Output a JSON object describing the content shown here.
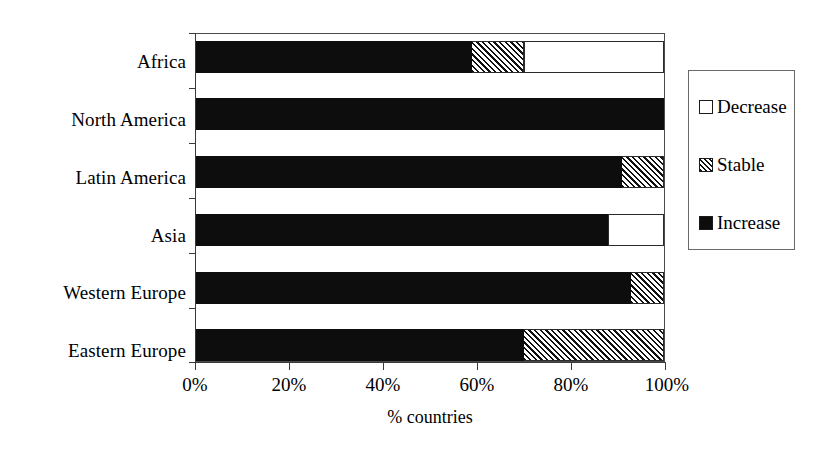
{
  "chart_data": {
    "type": "bar",
    "orientation": "horizontal",
    "stacked": true,
    "stacked_normalized": true,
    "title": "",
    "xlabel": "% countries",
    "ylabel": "",
    "xlim": [
      0,
      100
    ],
    "xticks": [
      "0%",
      "20%",
      "40%",
      "60%",
      "80%",
      "100%"
    ],
    "xtick_values": [
      0,
      20,
      40,
      60,
      80,
      100
    ],
    "grid": false,
    "legend_position": "right",
    "categories": [
      "Africa",
      "North America",
      "Latin America",
      "Asia",
      "Western Europe",
      "Eastern Europe"
    ],
    "series": [
      {
        "name": "Increase",
        "fill": "solid-black",
        "color": "#0d0d0d",
        "values": [
          59,
          100,
          91,
          88,
          93,
          70
        ]
      },
      {
        "name": "Stable",
        "fill": "diagonal-hatch",
        "color": "#111111",
        "values": [
          11,
          0,
          9,
          0,
          7,
          30
        ]
      },
      {
        "name": "Decrease",
        "fill": "white",
        "color": "#ffffff",
        "values": [
          30,
          0,
          0,
          12,
          0,
          0
        ]
      }
    ],
    "legend_entries": [
      {
        "label": "Decrease",
        "swatch": "sw-decrease"
      },
      {
        "label": "Stable",
        "swatch": "sw-stable"
      },
      {
        "label": "Increase",
        "swatch": "sw-increase"
      }
    ]
  }
}
